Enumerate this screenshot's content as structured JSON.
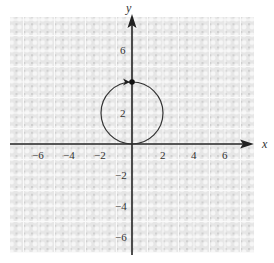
{
  "chart_data": {
    "type": "line",
    "title": "",
    "xlabel": "x",
    "ylabel": "y",
    "xlim": [
      -7.8,
      7.8
    ],
    "ylim": [
      -7.6,
      8.1
    ],
    "grid": true,
    "x_ticks": [
      -6,
      -4,
      -2,
      2,
      4,
      6
    ],
    "y_ticks": [
      6,
      2,
      -2,
      -4,
      -6
    ],
    "x_tick_labels": [
      "−6",
      "−4",
      "−2",
      "2",
      "4",
      "6"
    ],
    "y_tick_labels": [
      "6",
      "2",
      "−2",
      "−4",
      "−6"
    ],
    "series": [
      {
        "name": "circle",
        "shape": "circle",
        "center": [
          0,
          2
        ],
        "radius": 2,
        "equation": "x^2 + (y-2)^2 = 4",
        "color": "#333333"
      }
    ],
    "annotations": [
      {
        "type": "point",
        "x": 0,
        "y": 4,
        "marker": "filled-dot"
      },
      {
        "type": "direction-arrow",
        "x": -0.3,
        "y": 4,
        "direction": "clockwise-at-top"
      }
    ]
  },
  "colors": {
    "axis": "#222222",
    "curve": "#333333",
    "grid_bg": "#d9d9d9",
    "grid_line": "#f4f4f4"
  }
}
